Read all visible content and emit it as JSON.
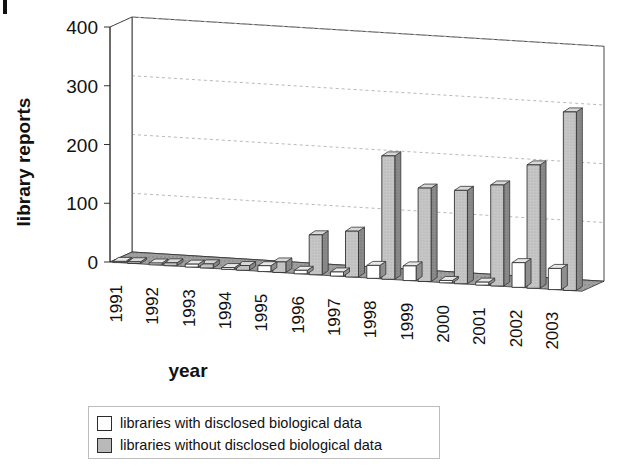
{
  "chart_data": {
    "type": "bar",
    "title": "",
    "xlabel": "year",
    "ylabel": "library reports",
    "ylim": [
      0,
      400
    ],
    "yticks": [
      0,
      100,
      200,
      300,
      400
    ],
    "grid": true,
    "legend_position": "bottom",
    "projection": "3d-perspective",
    "categories": [
      "1991",
      "1992",
      "1993",
      "1994",
      "1995",
      "1996",
      "1997",
      "1998",
      "1999",
      "2000",
      "2001",
      "2002",
      "2003"
    ],
    "series": [
      {
        "name": "libraries with disclosed biological data",
        "color": "#ffffff",
        "values": [
          2,
          3,
          5,
          3,
          10,
          6,
          7,
          22,
          25,
          4,
          5,
          42,
          36
        ]
      },
      {
        "name": "libraries without disclosed biological data",
        "color": "#b9b9b9",
        "values": [
          3,
          5,
          7,
          8,
          18,
          68,
          78,
          210,
          159,
          159,
          172,
          210,
          304
        ]
      }
    ]
  },
  "axes": {
    "y_title": "library reports",
    "x_title": "year",
    "y_tick_labels": [
      "400",
      "300",
      "200",
      "100",
      "0"
    ],
    "x_tick_labels": [
      "1991",
      "1992",
      "1993",
      "1994",
      "1995",
      "1996",
      "1997",
      "1998",
      "1999",
      "2000",
      "2001",
      "2002",
      "2003"
    ]
  },
  "legend": {
    "items": [
      {
        "label": "libraries with disclosed biological data",
        "swatch": "white"
      },
      {
        "label": "libraries without disclosed biological data",
        "swatch": "gray"
      }
    ]
  },
  "colors": {
    "bar_white_face": "#ffffff",
    "bar_white_side": "#8f8f8f",
    "bar_white_top": "#e8e8e8",
    "bar_gray_face": "#c2c2c2",
    "bar_gray_side": "#7d7d7d",
    "bar_gray_top": "#d8d8d8",
    "floor": "#9a9a9a",
    "grid": "#b0b0b0",
    "outline": "#333333",
    "text": "#111111"
  }
}
